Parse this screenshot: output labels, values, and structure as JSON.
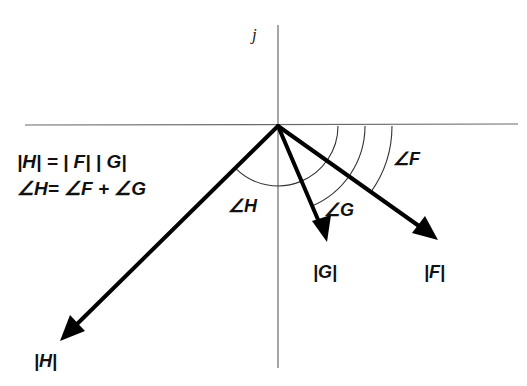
{
  "diagram": {
    "axis": {
      "imaginary_label": "j"
    },
    "origin": [
      278,
      126
    ],
    "vectors": [
      {
        "name": "F",
        "tip": [
          438,
          240
        ],
        "magnitude_label": "|F|"
      },
      {
        "name": "G",
        "tip": [
          327,
          242
        ],
        "magnitude_label": "|G|"
      },
      {
        "name": "H",
        "tip": [
          60,
          341
        ],
        "magnitude_label": "|H|"
      }
    ],
    "angle_labels": {
      "H": "∠H",
      "G": "∠G",
      "F": "∠F"
    },
    "equations": {
      "magnitude": "|H| = | F| | G|",
      "angle": "∠H= ∠F + ∠G"
    },
    "colors": {
      "vector": "#000000",
      "axis": "#6a6a6a",
      "arc": "#333333",
      "background": "#ffffff"
    }
  }
}
